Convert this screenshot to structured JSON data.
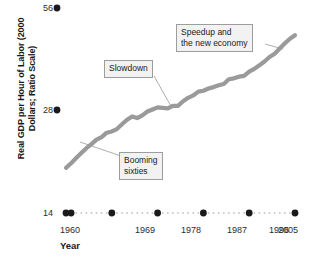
{
  "chart_data": {
    "type": "line",
    "title": "",
    "xlabel": "Year",
    "ylabel": "Real GDP per Hour of Labor (2000 Dollars; Ratio Scale)",
    "ylabel_line1": "Real GDP per Hour of Labor",
    "ylabel_line2": "(2000 Dollars; Ratio Scale)",
    "scale": "log",
    "grid": false,
    "legend": "none",
    "ylim": [
      14,
      56
    ],
    "yticks": [
      14,
      28,
      56
    ],
    "ytick_labels": [
      "14",
      "28",
      "56"
    ],
    "xlim": [
      1960,
      2005
    ],
    "xticks": [
      1960,
      1969,
      1978,
      1987,
      1996,
      2005
    ],
    "xtick_labels": [
      "1960",
      "1969",
      "1978",
      "1987",
      "1996",
      "2005"
    ],
    "series": [
      {
        "name": "Real GDP per Hour of Labor",
        "color": "#9a9a9a",
        "x": [
          1960,
          1961,
          1962,
          1963,
          1964,
          1965,
          1966,
          1967,
          1968,
          1969,
          1970,
          1971,
          1972,
          1973,
          1974,
          1975,
          1976,
          1977,
          1978,
          1979,
          1980,
          1981,
          1982,
          1983,
          1984,
          1985,
          1986,
          1987,
          1988,
          1989,
          1990,
          1991,
          1992,
          1993,
          1994,
          1995,
          1996,
          1997,
          1998,
          1999,
          2000,
          2001,
          2002,
          2003,
          2004,
          2005
        ],
        "values": [
          19.0,
          19.6,
          20.3,
          21.0,
          21.7,
          22.3,
          23.0,
          23.4,
          24.1,
          24.3,
          24.7,
          25.5,
          26.3,
          26.9,
          26.6,
          27.1,
          27.8,
          28.2,
          28.6,
          28.5,
          28.4,
          28.9,
          28.9,
          29.8,
          30.5,
          31.0,
          31.8,
          32.0,
          32.5,
          32.8,
          33.2,
          33.5,
          34.6,
          34.8,
          35.2,
          35.4,
          36.4,
          37.1,
          38.0,
          39.0,
          40.2,
          41.1,
          42.6,
          44.1,
          45.5,
          46.6
        ]
      }
    ],
    "annotations": [
      {
        "id": "booming-sixties",
        "lines": [
          "Booming",
          "sixties"
        ],
        "box": {
          "x": 119,
          "y": 152,
          "width": 44,
          "height": 26
        },
        "leader_to": {
          "x": 80,
          "y": 142
        }
      },
      {
        "id": "slowdown",
        "lines": [
          "Slowdown"
        ],
        "box": {
          "x": 104,
          "y": 60,
          "width": 56,
          "height": 16
        },
        "leader_to": {
          "x": 172,
          "y": 108
        }
      },
      {
        "id": "speedup-new-economy",
        "lines": [
          "Speedup and",
          "the new economy"
        ],
        "box": {
          "x": 176,
          "y": 24,
          "width": 89,
          "height": 26
        },
        "leader_to": {
          "x": 283,
          "y": 49
        }
      }
    ]
  }
}
